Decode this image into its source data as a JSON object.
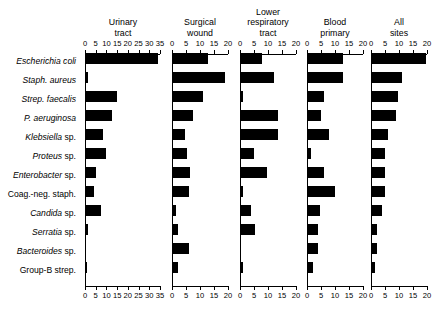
{
  "chart_data": {
    "type": "bar",
    "title": "",
    "subtitle": "",
    "xlabel": "",
    "ylabel": "",
    "orientation": "horizontal",
    "grid": false,
    "legend": "none",
    "categories": [
      "Escherichia coli",
      "Staph. aureus",
      "Strep. faecalis",
      "P. aeruginosa",
      "Klebsiella sp.",
      "Proteus sp.",
      "Enterobacter sp.",
      "Coag.-neg. staph.",
      "Candida sp.",
      "Serratia sp.",
      "Bacteroides sp.",
      "Group-B strep."
    ],
    "panels": [
      {
        "name": "urinary-tract",
        "title_lines": [
          "Urinary",
          "tract"
        ],
        "xlim": [
          0,
          35
        ],
        "ticks": [
          0,
          5,
          10,
          15,
          20,
          25,
          30,
          35
        ],
        "tick_labels": [
          "0",
          "5",
          "10",
          "15",
          "20",
          "25",
          "30",
          "35"
        ],
        "values": [
          34,
          1.5,
          15,
          12.5,
          8.5,
          10,
          5,
          4,
          7.5,
          1.5,
          0,
          1
        ]
      },
      {
        "name": "surgical-wound",
        "title_lines": [
          "Surgical",
          "wound"
        ],
        "xlim": [
          0,
          20
        ],
        "ticks": [
          0,
          5,
          10,
          15,
          20
        ],
        "tick_labels": [
          "0",
          "5",
          "10",
          "15",
          "20"
        ],
        "values": [
          13,
          19,
          11,
          7.5,
          4.5,
          5.5,
          6.5,
          6,
          1.5,
          2,
          6,
          2
        ]
      },
      {
        "name": "lower-respiratory-tract",
        "title_lines": [
          "Lower",
          "respiratory",
          "tract"
        ],
        "xlim": [
          0,
          20
        ],
        "ticks": [
          0,
          5,
          10,
          15,
          20
        ],
        "tick_labels": [
          "0",
          "5",
          "10",
          "15",
          "20"
        ],
        "values": [
          8,
          12,
          1,
          13.5,
          13.5,
          5,
          9.5,
          1,
          4,
          5.5,
          0.3,
          1
        ]
      },
      {
        "name": "blood-primary",
        "title_lines": [
          "Blood",
          "primary"
        ],
        "xlim": [
          0,
          20
        ],
        "ticks": [
          0,
          5,
          10,
          15,
          20
        ],
        "tick_labels": [
          "0",
          "5",
          "10",
          "15",
          "20"
        ],
        "values": [
          13,
          13,
          6,
          5,
          8,
          1.5,
          6,
          10,
          4.5,
          4,
          4,
          2
        ]
      },
      {
        "name": "all-sites",
        "title_lines": [
          "All",
          "sites"
        ],
        "xlim": [
          0,
          20
        ],
        "ticks": [
          0,
          5,
          10,
          15,
          20
        ],
        "tick_labels": [
          "0",
          "5",
          "10",
          "15",
          "20"
        ],
        "values": [
          19.5,
          11,
          9.5,
          9,
          6,
          5,
          5,
          5,
          4,
          2,
          2,
          1.5
        ]
      }
    ]
  },
  "style": {
    "bar_color": "#000000",
    "axis_color": "#000000",
    "background": "#ffffff"
  }
}
